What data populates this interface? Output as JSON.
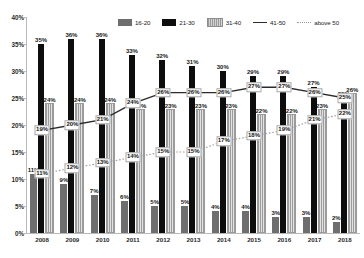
{
  "chart_data": {
    "type": "bar",
    "title": "",
    "xlabel": "",
    "ylabel": "",
    "ylim": [
      0,
      40
    ],
    "ytick_labels": [
      "0%",
      "5%",
      "10%",
      "15%",
      "20%",
      "25%",
      "30%",
      "35%",
      "40%"
    ],
    "ytick_values": [
      0,
      5,
      10,
      15,
      20,
      25,
      30,
      35,
      40
    ],
    "grid": false,
    "legend_position": "top",
    "categories": [
      "2008",
      "2009",
      "2010",
      "2011",
      "2012",
      "2013",
      "2014",
      "2015",
      "2016",
      "2017",
      "2018"
    ],
    "series": [
      {
        "name": "16-20",
        "kind": "bar",
        "style": "solid-gray",
        "color": "#6e6e6e",
        "values": [
          11,
          9,
          7,
          6,
          5,
          5,
          4,
          4,
          3,
          3,
          2
        ],
        "labels": [
          "11%",
          "9%",
          "7%",
          "6%",
          "5%",
          "5%",
          "4%",
          "4%",
          "3%",
          "3%",
          "2%"
        ]
      },
      {
        "name": "21-30",
        "kind": "bar",
        "style": "solid-black",
        "color": "#0d0d0d",
        "values": [
          35,
          36,
          36,
          33,
          32,
          31,
          30,
          29,
          29,
          27,
          25
        ],
        "labels": [
          "35%",
          "36%",
          "36%",
          "33%",
          "32%",
          "31%",
          "30%",
          "29%",
          "29%",
          "27%",
          "25%"
        ]
      },
      {
        "name": "31-40",
        "kind": "bar",
        "style": "hatched",
        "color": "#d6d6d6",
        "values": [
          24,
          24,
          24,
          23,
          23,
          23,
          23,
          22,
          22,
          23,
          26
        ],
        "labels": [
          "24%",
          "24%",
          "24%",
          "23%",
          "23%",
          "23%",
          "23%",
          "22%",
          "22%",
          "23%",
          "26%"
        ]
      },
      {
        "name": "41-50",
        "kind": "line",
        "style": "solid",
        "color": "#2b2b2b",
        "values": [
          19,
          20,
          21,
          24,
          26,
          26,
          26,
          27,
          27,
          26,
          25
        ],
        "labels": [
          "19%",
          "20%",
          "21%",
          "24%",
          "26%",
          "26%",
          "26%",
          "27%",
          "27%",
          "26%",
          "25%"
        ]
      },
      {
        "name": "above 50",
        "kind": "line",
        "style": "dotted",
        "color": "#9b9b9b",
        "values": [
          11,
          12,
          13,
          14,
          15,
          15,
          17,
          18,
          19,
          21,
          22
        ],
        "labels": [
          "11%",
          "12%",
          "13%",
          "14%",
          "15%",
          "15%",
          "17%",
          "18%",
          "19%",
          "21%",
          "22%"
        ]
      }
    ]
  },
  "legend": {
    "items": [
      {
        "label": "16-20",
        "key": "k-1620",
        "icon": "bar-swatch-gray-icon"
      },
      {
        "label": "21-30",
        "key": "k-2130",
        "icon": "bar-swatch-black-icon"
      },
      {
        "label": "31-40",
        "key": "k-3140",
        "icon": "bar-swatch-hatched-icon"
      },
      {
        "label": "41-50",
        "key": "k-4150",
        "icon": "line-solid-icon"
      },
      {
        "label": "above 50",
        "key": "k-above",
        "icon": "line-dotted-icon"
      }
    ]
  }
}
